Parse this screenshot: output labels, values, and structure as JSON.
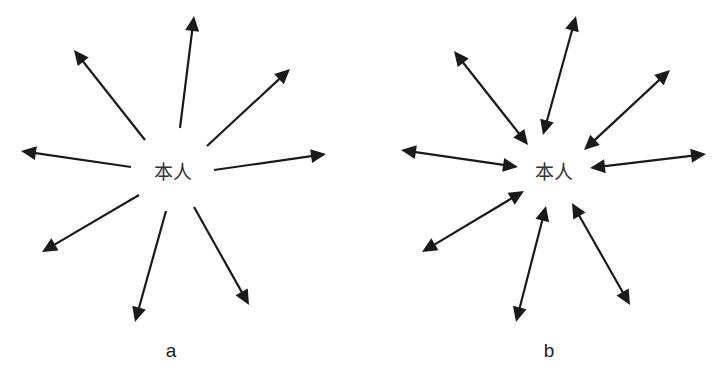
{
  "panels": [
    {
      "id": "a",
      "label": "a",
      "center_text": "本人",
      "center": [
        173,
        172
      ],
      "label_pos": [
        171,
        357
      ],
      "arrow_type": "outward",
      "arrows": [
        {
          "name": "top",
          "from": [
            180,
            128
          ],
          "to": [
            194,
            16
          ]
        },
        {
          "name": "upper-left",
          "from": [
            145,
            140
          ],
          "to": [
            74,
            50
          ]
        },
        {
          "name": "upper-right",
          "from": [
            207,
            146
          ],
          "to": [
            290,
            69
          ]
        },
        {
          "name": "left",
          "from": [
            131,
            167
          ],
          "to": [
            21,
            151
          ]
        },
        {
          "name": "right",
          "from": [
            214,
            170
          ],
          "to": [
            326,
            154
          ]
        },
        {
          "name": "lower-left",
          "from": [
            139,
            195
          ],
          "to": [
            42,
            252
          ]
        },
        {
          "name": "bottom",
          "from": [
            166,
            211
          ],
          "to": [
            135,
            322
          ]
        },
        {
          "name": "lower-right",
          "from": [
            194,
            207
          ],
          "to": [
            249,
            305
          ]
        }
      ]
    },
    {
      "id": "b",
      "label": "b",
      "center_text": "本人",
      "center": [
        554,
        172
      ],
      "label_pos": [
        549,
        357
      ],
      "arrow_type": "bidirectional",
      "arrows": [
        {
          "name": "top",
          "from": [
            543,
            135
          ],
          "to": [
            576,
            16
          ]
        },
        {
          "name": "upper-left",
          "from": [
            528,
            145
          ],
          "to": [
            454,
            51
          ]
        },
        {
          "name": "upper-right",
          "from": [
            584,
            150
          ],
          "to": [
            670,
            70
          ]
        },
        {
          "name": "left",
          "from": [
            518,
            167
          ],
          "to": [
            401,
            150
          ]
        },
        {
          "name": "right",
          "from": [
            590,
            168
          ],
          "to": [
            706,
            154
          ]
        },
        {
          "name": "lower-left",
          "from": [
            524,
            191
          ],
          "to": [
            422,
            252
          ]
        },
        {
          "name": "bottom",
          "from": [
            546,
            206
          ],
          "to": [
            516,
            322
          ]
        },
        {
          "name": "lower-right",
          "from": [
            572,
            203
          ],
          "to": [
            630,
            305
          ]
        }
      ]
    }
  ],
  "colors": {
    "arrow": "#1a1a1a",
    "text": "#333333",
    "background": "#ffffff"
  }
}
